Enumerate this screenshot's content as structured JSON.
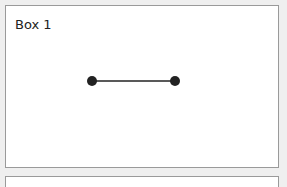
{
  "boxes": [
    {
      "label": "Box 1",
      "connector": {
        "start": {
          "x": 92,
          "y": 81
        },
        "end": {
          "x": 175,
          "y": 81
        },
        "color": "#222222"
      }
    },
    {
      "label": ""
    }
  ],
  "colors": {
    "background": "#efefef",
    "box_fill": "#ffffff",
    "box_border": "#9a9a9a",
    "line": "#222222"
  }
}
